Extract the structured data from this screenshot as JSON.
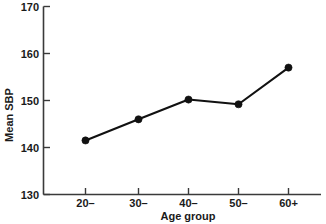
{
  "chart_data": {
    "type": "line",
    "title": "",
    "xlabel": "Age group",
    "ylabel": "Mean SBP",
    "categories": [
      "20–",
      "30–",
      "40–",
      "50–",
      "60+"
    ],
    "values": [
      141.5,
      146.0,
      150.2,
      149.2,
      157.0
    ],
    "series": [
      {
        "name": "Mean SBP",
        "values": [
          141.5,
          146.0,
          150.2,
          149.2,
          157.0
        ]
      }
    ],
    "ylim": [
      130,
      170
    ],
    "yticks": [
      130,
      140,
      150,
      160,
      170
    ],
    "ytick_labels": [
      "130",
      "140",
      "150",
      "160",
      "170"
    ],
    "xtick_labels": [
      "20–",
      "30–",
      "40–",
      "50–",
      "60+"
    ],
    "grid": false,
    "legend": false,
    "legend_position": "none",
    "marker": "filled-circle",
    "line_color": "#111111",
    "marker_color": "#111111",
    "axis_color": "#3a3a3a",
    "background_color": "#ffffff"
  },
  "axes": {
    "y_label": "Mean SBP",
    "x_label": "Age group"
  }
}
